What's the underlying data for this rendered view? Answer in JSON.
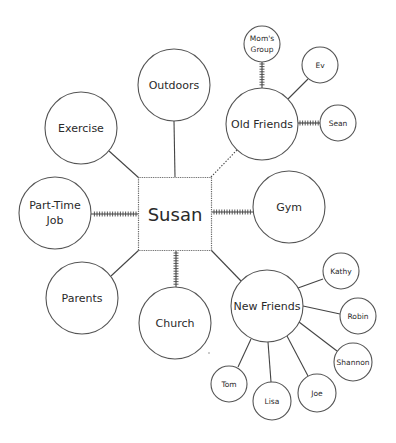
{
  "diagram": {
    "type": "ecomap",
    "center": {
      "id": "susan",
      "label": "Susan",
      "x": 175,
      "y": 214,
      "size": 73
    },
    "nodes": [
      {
        "id": "outdoors",
        "label": [
          "Outdoors"
        ],
        "x": 174,
        "y": 85,
        "r": 36,
        "size": "large"
      },
      {
        "id": "exercise",
        "label": [
          "Exercise"
        ],
        "x": 81,
        "y": 128,
        "r": 36,
        "size": "large"
      },
      {
        "id": "part-time-job",
        "label": [
          "Part-Time",
          "Job"
        ],
        "x": 55,
        "y": 213,
        "r": 36,
        "size": "large"
      },
      {
        "id": "parents",
        "label": [
          "Parents"
        ],
        "x": 82,
        "y": 298,
        "r": 36,
        "size": "large"
      },
      {
        "id": "church",
        "label": [
          "Church"
        ],
        "x": 175,
        "y": 323,
        "r": 36,
        "size": "large"
      },
      {
        "id": "gym",
        "label": [
          "Gym"
        ],
        "x": 289,
        "y": 207,
        "r": 36,
        "size": "large"
      },
      {
        "id": "old-friends",
        "label": [
          "Old Friends"
        ],
        "x": 262,
        "y": 124,
        "r": 36,
        "size": "large"
      },
      {
        "id": "new-friends",
        "label": [
          "New Friends"
        ],
        "x": 267,
        "y": 306,
        "r": 36,
        "size": "large"
      },
      {
        "id": "moms-group",
        "label": [
          "Mom's",
          "Group"
        ],
        "x": 262,
        "y": 44,
        "r": 18,
        "size": "small"
      },
      {
        "id": "ev",
        "label": [
          "Ev"
        ],
        "x": 320,
        "y": 65,
        "r": 18,
        "size": "small"
      },
      {
        "id": "sean",
        "label": [
          "Sean"
        ],
        "x": 338,
        "y": 123,
        "r": 18,
        "size": "small"
      },
      {
        "id": "kathy",
        "label": [
          "Kathy"
        ],
        "x": 341,
        "y": 271,
        "r": 18,
        "size": "small"
      },
      {
        "id": "robin",
        "label": [
          "Robin"
        ],
        "x": 358,
        "y": 316,
        "r": 18,
        "size": "small"
      },
      {
        "id": "shannon",
        "label": [
          "Shannon"
        ],
        "x": 353,
        "y": 362,
        "r": 19,
        "size": "small"
      },
      {
        "id": "joe",
        "label": [
          "Joe"
        ],
        "x": 317,
        "y": 393,
        "r": 19,
        "size": "small"
      },
      {
        "id": "lisa",
        "label": [
          "Lisa"
        ],
        "x": 272,
        "y": 401,
        "r": 19,
        "size": "small"
      },
      {
        "id": "tom",
        "label": [
          "Tom"
        ],
        "x": 229,
        "y": 384,
        "r": 18,
        "size": "small"
      }
    ],
    "edges": [
      {
        "from": "susan",
        "to": "outdoors",
        "style": "solid",
        "x1": 175,
        "y1": 177,
        "x2": 174,
        "y2": 121
      },
      {
        "from": "susan",
        "to": "exercise",
        "style": "solid",
        "x1": 139,
        "y1": 178,
        "x2": 109,
        "y2": 151
      },
      {
        "from": "susan",
        "to": "part-time-job",
        "style": "hatched",
        "x1": 138,
        "y1": 214,
        "x2": 91,
        "y2": 214
      },
      {
        "from": "susan",
        "to": "parents",
        "style": "solid",
        "x1": 139,
        "y1": 250,
        "x2": 111,
        "y2": 276
      },
      {
        "from": "susan",
        "to": "church",
        "style": "hatched",
        "x1": 176,
        "y1": 251,
        "x2": 176,
        "y2": 287
      },
      {
        "from": "susan",
        "to": "gym",
        "style": "hatched",
        "x1": 212,
        "y1": 212,
        "x2": 253,
        "y2": 212
      },
      {
        "from": "susan",
        "to": "old-friends",
        "style": "dotted",
        "x1": 211,
        "y1": 177,
        "x2": 237,
        "y2": 150
      },
      {
        "from": "susan",
        "to": "new-friends",
        "style": "solid",
        "x1": 211,
        "y1": 250,
        "x2": 241,
        "y2": 281
      },
      {
        "from": "old-friends",
        "to": "moms-group",
        "style": "hatched",
        "x1": 262,
        "y1": 62,
        "x2": 262,
        "y2": 88
      },
      {
        "from": "old-friends",
        "to": "ev",
        "style": "solid",
        "x1": 288,
        "y1": 99,
        "x2": 308,
        "y2": 79
      },
      {
        "from": "old-friends",
        "to": "sean",
        "style": "hatched",
        "x1": 298,
        "y1": 123,
        "x2": 320,
        "y2": 123
      },
      {
        "from": "new-friends",
        "to": "kathy",
        "style": "solid",
        "x1": 298,
        "y1": 288,
        "x2": 323,
        "y2": 279
      },
      {
        "from": "new-friends",
        "to": "robin",
        "style": "solid",
        "x1": 303,
        "y1": 306,
        "x2": 340,
        "y2": 314
      },
      {
        "from": "new-friends",
        "to": "shannon",
        "style": "solid",
        "x1": 299,
        "y1": 322,
        "x2": 337,
        "y2": 351
      },
      {
        "from": "new-friends",
        "to": "joe",
        "style": "solid",
        "x1": 287,
        "y1": 336,
        "x2": 308,
        "y2": 376
      },
      {
        "from": "new-friends",
        "to": "lisa",
        "style": "solid",
        "x1": 268,
        "y1": 342,
        "x2": 271,
        "y2": 382
      },
      {
        "from": "new-friends",
        "to": "tom",
        "style": "solid",
        "x1": 251,
        "y1": 339,
        "x2": 238,
        "y2": 367
      }
    ],
    "artifacts": [
      {
        "x": 209,
        "y": 353,
        "r": 0.8
      }
    ]
  }
}
